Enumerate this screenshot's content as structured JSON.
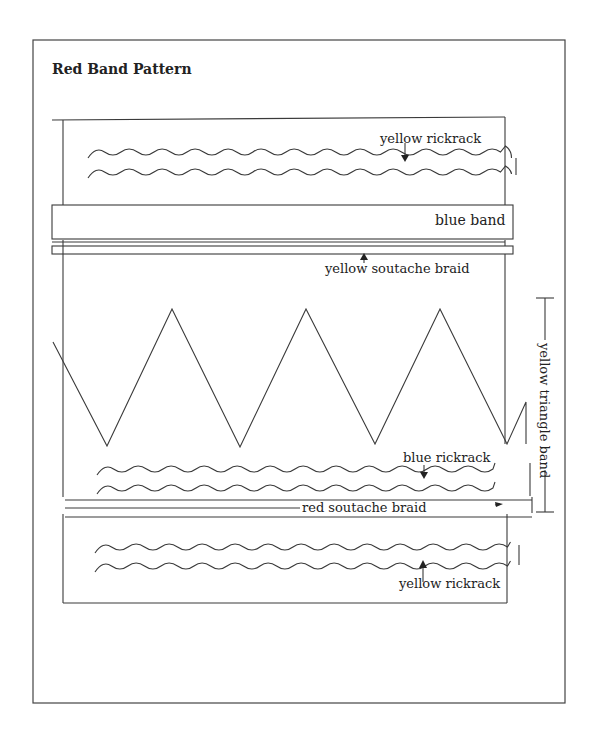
{
  "title": "Red Band Pattern",
  "labels": {
    "top_rickrack": "yellow rickrack",
    "blue_band": "blue band",
    "yellow_soutache": "yellow soutache braid",
    "triangle_band": "yellow triangle band",
    "blue_rickrack": "blue rickrack",
    "red_soutache": "red soutache braid",
    "bottom_rickrack": "yellow rickrack"
  },
  "colors": {
    "line": "#3a3a3a",
    "background": "#ffffff"
  }
}
